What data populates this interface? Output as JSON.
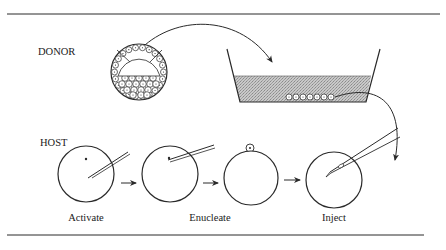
{
  "figure": {
    "sections": {
      "donor_label": "DONOR",
      "host_label": "HOST"
    },
    "steps": [
      {
        "label": "Activate"
      },
      {
        "label": "Enucleate"
      },
      {
        "label": "Inject"
      }
    ],
    "colors": {
      "line": "#2a2a2a",
      "medium_fill": "#bdbdbd",
      "background": "#ffffff"
    },
    "donor_cells_in_dish": 7
  }
}
